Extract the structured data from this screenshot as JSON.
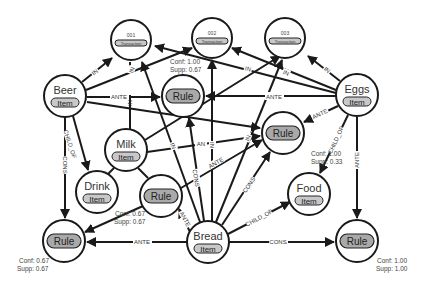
{
  "diagram": {
    "type": "association-rule-graph",
    "nodes": [
      {
        "id": "t001",
        "title": "001",
        "type": "Transaction"
      },
      {
        "id": "t002",
        "title": "002",
        "type": "Transaction"
      },
      {
        "id": "t003",
        "title": "003",
        "type": "Transaction"
      },
      {
        "id": "beer",
        "title": "Beer",
        "type": "Item"
      },
      {
        "id": "eggs",
        "title": "Eggs",
        "type": "Item"
      },
      {
        "id": "milk",
        "title": "Milk",
        "type": "Item"
      },
      {
        "id": "drink",
        "title": "Drink",
        "type": "Item"
      },
      {
        "id": "food",
        "title": "Food",
        "type": "Item"
      },
      {
        "id": "bread",
        "title": "Bread",
        "type": "Item"
      },
      {
        "id": "rule_top",
        "title": "",
        "type": "Rule"
      },
      {
        "id": "rule_right",
        "title": "",
        "type": "Rule"
      },
      {
        "id": "rule_mid",
        "title": "",
        "type": "Rule"
      },
      {
        "id": "rule_bl",
        "title": "",
        "type": "Rule"
      },
      {
        "id": "rule_br",
        "title": "",
        "type": "Rule"
      }
    ],
    "metrics": [
      {
        "rule": "rule_top",
        "conf": "Conf: 1.00",
        "supp": "Supp: 0.67"
      },
      {
        "rule": "rule_right",
        "conf": "Conf: 1.00",
        "supp": "Supp: 0.33"
      },
      {
        "rule": "rule_mid",
        "conf": "Conf: 0.67",
        "supp": "Supp: 0.67"
      },
      {
        "rule": "rule_bl",
        "conf": "Conf: 0.67",
        "supp": "Supp: 0.67"
      },
      {
        "rule": "rule_br",
        "conf": "Conf: 1.00",
        "supp": "Supp: 1.00"
      }
    ],
    "edge_labels": {
      "in": "IN",
      "ante": "ANTE",
      "cons": "CONS",
      "child_of": "CHILD_OF",
      "an": "AN"
    },
    "edges": [
      {
        "from": "beer",
        "to": "t001",
        "label": "IN"
      },
      {
        "from": "beer",
        "to": "t002",
        "label": "IN"
      },
      {
        "from": "beer",
        "to": "rule_top",
        "label": "ANTE"
      },
      {
        "from": "beer",
        "to": "rule_right",
        "label": "AN"
      },
      {
        "from": "beer",
        "to": "drink",
        "label": "CHILD_OF"
      },
      {
        "from": "beer",
        "to": "rule_bl",
        "label": "CONS"
      },
      {
        "from": "eggs",
        "to": "t003",
        "label": "IN"
      },
      {
        "from": "eggs",
        "to": "t002",
        "label": "IN"
      },
      {
        "from": "eggs",
        "to": "t001",
        "label": "IN"
      },
      {
        "from": "eggs",
        "to": "rule_top",
        "label": "ANTE"
      },
      {
        "from": "eggs",
        "to": "rule_right",
        "label": "ANTE"
      },
      {
        "from": "eggs",
        "to": "food",
        "label": "CHILD_OF"
      },
      {
        "from": "eggs",
        "to": "rule_br",
        "label": "ANTE"
      },
      {
        "from": "milk",
        "to": "t001",
        "label": "IN"
      },
      {
        "from": "milk",
        "to": "t003",
        "label": "IN"
      },
      {
        "from": "milk",
        "to": "rule_right",
        "label": "AN"
      },
      {
        "from": "milk",
        "to": "drink",
        "label": "CHILD_OF"
      },
      {
        "from": "milk",
        "to": "rule_mid",
        "label": "INS"
      },
      {
        "from": "bread",
        "to": "t001",
        "label": "IN"
      },
      {
        "from": "bread",
        "to": "t002",
        "label": "IN"
      },
      {
        "from": "bread",
        "to": "t003",
        "label": "IN"
      },
      {
        "from": "bread",
        "to": "rule_top",
        "label": "CONS"
      },
      {
        "from": "bread",
        "to": "rule_right",
        "label": "ANTE"
      },
      {
        "from": "bread",
        "to": "rule_mid",
        "label": "ANTE"
      },
      {
        "from": "bread",
        "to": "food",
        "label": "CHILD_OF"
      },
      {
        "from": "bread",
        "to": "rule_bl",
        "label": "ANTE"
      },
      {
        "from": "bread",
        "to": "rule_br",
        "label": "CONS"
      },
      {
        "from": "bread",
        "to": "rule_right",
        "label": "CONS"
      },
      {
        "from": "rule_mid",
        "to": "rule_bl",
        "label": ""
      }
    ]
  }
}
